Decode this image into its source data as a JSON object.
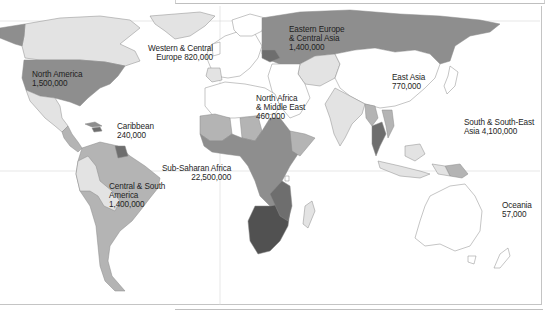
{
  "map": {
    "type": "choropleth",
    "colors": {
      "ocean": "#ffffff",
      "no_data": "#ffffff",
      "level_1": "#e3e3e3",
      "level_2": "#b4b4b4",
      "level_3": "#8e8e8e",
      "level_4": "#6e6e6e",
      "level_5": "#515151",
      "border": "#8a8a8a"
    },
    "regions": [
      {
        "id": "north-america",
        "name": "North America",
        "value": "1,500,000"
      },
      {
        "id": "caribbean",
        "name": "Caribbean",
        "value": "240,000"
      },
      {
        "id": "central-south-america",
        "name_line1": "Central & South",
        "name_line2": "America",
        "value": "1,400,000"
      },
      {
        "id": "western-central-europe",
        "name_line1": "Western & Central",
        "name_line2": "Europe",
        "value": "820,000"
      },
      {
        "id": "eastern-europe-central-asia",
        "name_line1": "Eastern Europe",
        "name_line2": "& Central Asia",
        "value": "1,400,000"
      },
      {
        "id": "north-africa-middle-east",
        "name_line1": "North Africa",
        "name_line2": "& Middle East",
        "value": "460,000"
      },
      {
        "id": "sub-saharan-africa",
        "name": "Sub-Saharan Africa",
        "value": "22,500,000"
      },
      {
        "id": "east-asia",
        "name": "East Asia",
        "value": "770,000"
      },
      {
        "id": "south-southeast-asia",
        "name_line1": "South & South-East",
        "name_line2": "Asia",
        "value": "4,100,000"
      },
      {
        "id": "oceania",
        "name": "Oceania",
        "value": "57,000"
      }
    ]
  },
  "labels": {
    "north_america_1": "North America",
    "north_america_2": "1,500,000",
    "caribbean_1": "Caribbean",
    "caribbean_2": "240,000",
    "csa_1": "Central & South",
    "csa_2": "America",
    "csa_3": "1,400,000",
    "wce_1": "Western & Central",
    "wce_2": "Europe 820,000",
    "eeca_1": "Eastern Europe",
    "eeca_2": "& Central Asia",
    "eeca_3": "1,400,000",
    "name_1": "North Africa",
    "name_2": "& Middle East",
    "name_3": "460,000",
    "ssa_1": "Sub-Saharan Africa",
    "ssa_2": "22,500,000",
    "ea_1": "East Asia",
    "ea_2": "770,000",
    "ssea_1": "South & South-East",
    "ssea_2": "Asia 4,100,000",
    "oc_1": "Oceania",
    "oc_2": "57,000"
  }
}
